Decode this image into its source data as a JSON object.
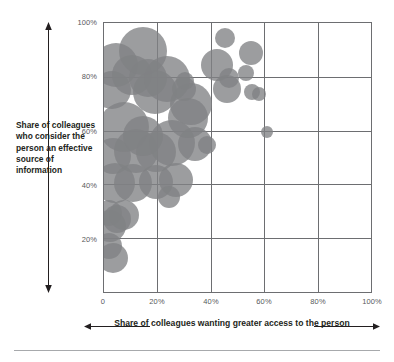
{
  "chart_data": {
    "type": "scatter",
    "title": "",
    "xlabel": "Share of colleagues wanting greater access to the person",
    "ylabel": "Share of colleagues who consider the person an effective source of information",
    "xlim": [
      0,
      100
    ],
    "ylim": [
      0,
      100
    ],
    "x_ticks": [
      "0",
      "20%",
      "40%",
      "60%",
      "80%",
      "100%"
    ],
    "x_tick_values": [
      0,
      20,
      40,
      60,
      80,
      100
    ],
    "y_ticks": [
      "20%",
      "40%",
      "60%",
      "80%",
      "100%"
    ],
    "y_tick_values": [
      20,
      40,
      60,
      80,
      100
    ],
    "grid": true,
    "legend": "none",
    "bubble_color": "#808184",
    "grid_color": "#6d6e71",
    "points": [
      {
        "x": 2.0,
        "y": 17.0,
        "size": 13
      },
      {
        "x": 3.5,
        "y": 12.5,
        "size": 15
      },
      {
        "x": 1.8,
        "y": 29.5,
        "size": 13
      },
      {
        "x": 2.2,
        "y": 24.5,
        "size": 16
      },
      {
        "x": 4.8,
        "y": 27.0,
        "size": 14
      },
      {
        "x": 7.5,
        "y": 28.5,
        "size": 15
      },
      {
        "x": 4.0,
        "y": 40.5,
        "size": 20
      },
      {
        "x": 11.0,
        "y": 40.5,
        "size": 19
      },
      {
        "x": 19.5,
        "y": 41.0,
        "size": 17
      },
      {
        "x": 27.0,
        "y": 41.5,
        "size": 17
      },
      {
        "x": 24.5,
        "y": 35.5,
        "size": 11
      },
      {
        "x": 3.5,
        "y": 50.5,
        "size": 18
      },
      {
        "x": 12.0,
        "y": 52.5,
        "size": 22
      },
      {
        "x": 19.5,
        "y": 52.0,
        "size": 20
      },
      {
        "x": 25.5,
        "y": 55.5,
        "size": 23
      },
      {
        "x": 34.0,
        "y": 55.0,
        "size": 17
      },
      {
        "x": 38.5,
        "y": 54.5,
        "size": 9
      },
      {
        "x": 61.0,
        "y": 59.5,
        "size": 6
      },
      {
        "x": 7.5,
        "y": 61.5,
        "size": 25
      },
      {
        "x": 14.5,
        "y": 58.0,
        "size": 20
      },
      {
        "x": 31.5,
        "y": 64.5,
        "size": 20
      },
      {
        "x": 32.5,
        "y": 70.0,
        "size": 21
      },
      {
        "x": 3.0,
        "y": 75.0,
        "size": 19
      },
      {
        "x": 19.0,
        "y": 74.5,
        "size": 22
      },
      {
        "x": 30.0,
        "y": 75.5,
        "size": 12
      },
      {
        "x": 30.5,
        "y": 78.5,
        "size": 9
      },
      {
        "x": 46.0,
        "y": 75.5,
        "size": 14
      },
      {
        "x": 47.0,
        "y": 79.5,
        "size": 10
      },
      {
        "x": 55.5,
        "y": 74.5,
        "size": 8
      },
      {
        "x": 58.0,
        "y": 73.5,
        "size": 7
      },
      {
        "x": 4.5,
        "y": 84.5,
        "size": 22
      },
      {
        "x": 10.5,
        "y": 80.5,
        "size": 20
      },
      {
        "x": 16.5,
        "y": 79.5,
        "size": 19
      },
      {
        "x": 23.5,
        "y": 79.0,
        "size": 23
      },
      {
        "x": 53.0,
        "y": 81.5,
        "size": 8
      },
      {
        "x": 14.5,
        "y": 89.5,
        "size": 24
      },
      {
        "x": 42.5,
        "y": 84.5,
        "size": 16
      },
      {
        "x": 55.0,
        "y": 89.0,
        "size": 12
      },
      {
        "x": 45.5,
        "y": 94.5,
        "size": 10
      }
    ]
  }
}
